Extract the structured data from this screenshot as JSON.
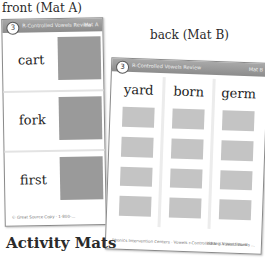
{
  "labels": {
    "front": "front (Mat A)",
    "back": "back (Mat B)"
  },
  "title": "Activity Mats",
  "mat_a": {
    "lesson_number": "3",
    "header": "R-Controlled Vowels Review",
    "tag": "Mat A",
    "words": [
      "cart",
      "fork",
      "first"
    ],
    "footer": "© Great Source Copy · 1-800-..."
  },
  "mat_b": {
    "lesson_number": "3",
    "header": "R-Controlled Vowels Review",
    "tag": "Mat B",
    "columns": [
      "yard",
      "born",
      "germ"
    ],
    "rows_per_column": 4,
    "footer_left": "Phonics Intervention Centers · Vowels r-Controlled and Vowel Sounds",
    "footer_right": "ISBN 1-X Word Work · ..."
  },
  "colors": {
    "band": "#999999",
    "picture_box_a": "#9a9a9a",
    "picture_box_b": "#c4c4c4"
  }
}
